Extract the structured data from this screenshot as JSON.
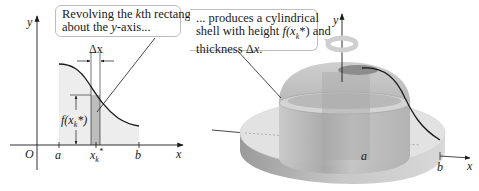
{
  "figure": {
    "left_panel": {
      "axis_labels": {
        "x": "x",
        "y": "y",
        "origin": "O"
      },
      "tick_labels": {
        "a": "a",
        "xk": "x",
        "xk_sub": "k",
        "xk_sup": "*",
        "b": "b"
      },
      "delta_label": "Δx",
      "height_label": "f(x",
      "height_label_sub": "k",
      "height_label_tail": "*)",
      "callout": {
        "line1_pre": "Revolving the ",
        "line1_k": "k",
        "line1_post": "th rectangle",
        "line2_pre": "about the ",
        "line2_y": "y",
        "line2_post": "-axis..."
      }
    },
    "right_panel": {
      "axis_labels": {
        "x": "x",
        "y": "y"
      },
      "tick_labels": {
        "a": "a",
        "b": "b"
      },
      "callout": {
        "line1": "... produces a cylindrical",
        "line2_pre": "shell with height ",
        "line2_f": "f",
        "line2_paren": "(x",
        "line2_sub": "k",
        "line2_post": "*) and",
        "line3_pre": "thickness Δ",
        "line3_x": "x",
        "line3_post": "."
      }
    },
    "colors": {
      "region_fill": "#ededed",
      "rect_fill": "#bdbdbd",
      "curve": "#1a1a1a",
      "axis": "#1a1a1a",
      "callout_border": "#bdbdbd"
    }
  }
}
